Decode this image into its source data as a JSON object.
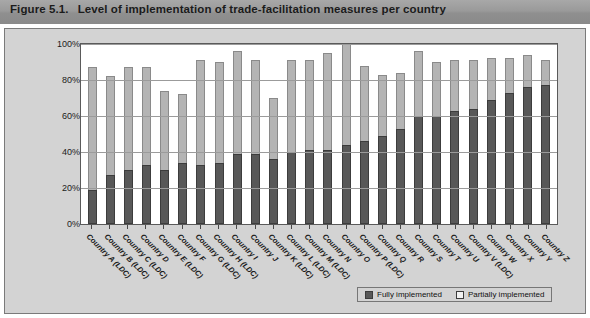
{
  "figure": {
    "number": "Figure 5.1.",
    "title": "Level of implementation of trade-facilitation measures per country"
  },
  "legend": {
    "fully_label": "Fully implemented",
    "partially_label": "Partially implemented",
    "fully_icon": "filled-square-icon",
    "partially_icon": "empty-square-icon"
  },
  "chart_data": {
    "type": "bar",
    "stacked": true,
    "title": "Level of implementation of trade-facilitation measures per country",
    "xlabel": "",
    "ylabel": "",
    "ylim": [
      0,
      100
    ],
    "yticks": [
      "0%",
      "20%",
      "40%",
      "60%",
      "80%",
      "100%"
    ],
    "ytick_values": [
      0,
      20,
      40,
      60,
      80,
      100
    ],
    "grid": true,
    "legend_position": "bottom-right",
    "categories": [
      "Country A (LDC)",
      "Country B (LDC)",
      "Country C (LDC)",
      "Country D",
      "Country E (LDC)",
      "Country F",
      "Country G (LDC)",
      "Country H (LDC)",
      "Country I",
      "Country J",
      "Country K (LDC)",
      "Country L (LDC)",
      "Country M (LDC)",
      "Country N",
      "Country O",
      "Country P (LDC)",
      "Country Q",
      "Country R",
      "Country S",
      "Country T",
      "Country U",
      "Country V (LDC)",
      "Country W",
      "Country X",
      "Country Y",
      "Country Z"
    ],
    "series": [
      {
        "name": "Fully implemented",
        "color": "#585858",
        "values": [
          19,
          27,
          30,
          33,
          30,
          34,
          33,
          34,
          39,
          39,
          36,
          40,
          41,
          41,
          44,
          46,
          49,
          53,
          60,
          60,
          63,
          64,
          69,
          73,
          76,
          77
        ]
      },
      {
        "name": "Partially implemented",
        "color": "#b4b4b4",
        "values": [
          68,
          55,
          57,
          54,
          44,
          38,
          58,
          56,
          57,
          52,
          34,
          51,
          50,
          54,
          56,
          42,
          34,
          31,
          36,
          30,
          28,
          27,
          23,
          19,
          18,
          14
        ]
      }
    ],
    "totals": [
      87,
      82,
      87,
      87,
      74,
      72,
      91,
      90,
      96,
      91,
      70,
      91,
      91,
      95,
      100,
      88,
      83,
      84,
      96,
      90,
      91,
      91,
      92,
      92,
      94,
      91
    ]
  }
}
